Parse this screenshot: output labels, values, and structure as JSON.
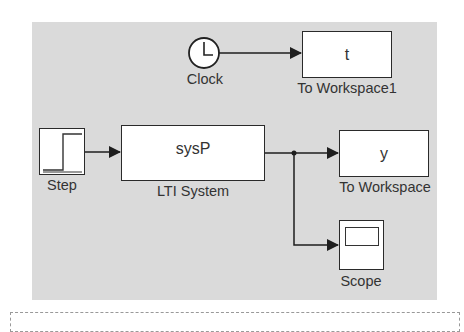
{
  "diagram": {
    "type": "simulink-model",
    "background": "#dadada",
    "blocks": [
      {
        "id": "clock",
        "type": "Clock",
        "label": "Clock"
      },
      {
        "id": "to_workspace1",
        "type": "To Workspace",
        "label": "To Workspace1",
        "content": "t"
      },
      {
        "id": "step",
        "type": "Step",
        "label": "Step"
      },
      {
        "id": "lti_system",
        "type": "LTI System",
        "label": "LTI System",
        "content": "sysP"
      },
      {
        "id": "to_workspace",
        "type": "To Workspace",
        "label": "To Workspace",
        "content": "y"
      },
      {
        "id": "scope",
        "type": "Scope",
        "label": "Scope"
      }
    ],
    "connections": [
      {
        "from": "clock",
        "to": "to_workspace1"
      },
      {
        "from": "step",
        "to": "lti_system"
      },
      {
        "from": "lti_system",
        "to": "to_workspace"
      },
      {
        "from": "lti_system",
        "to": "scope",
        "branch": true
      }
    ]
  }
}
